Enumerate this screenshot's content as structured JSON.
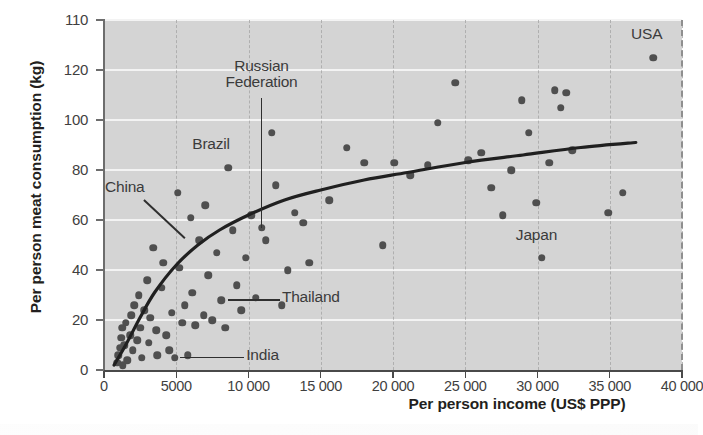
{
  "chart_data": {
    "type": "scatter",
    "title": "",
    "xlabel": "Per person income (US$ PPP)",
    "ylabel": "Per person meat consumption (kg)",
    "xlim": [
      0,
      40000
    ],
    "ylim": [
      0,
      140
    ],
    "xticks": [
      0,
      5000,
      10000,
      15000,
      20000,
      25000,
      30000,
      35000,
      40000
    ],
    "xticklabels": [
      "0",
      "5000",
      "10 000",
      "15 000",
      "20 000",
      "25 000",
      "30 000",
      "35 000",
      "40 000"
    ],
    "yticks": [
      0,
      20,
      40,
      60,
      80,
      100,
      120,
      140
    ],
    "yticklabels": [
      "0",
      "20",
      "40",
      "60",
      "80",
      "100",
      "120",
      "110"
    ],
    "grid": "horizontal-white-lines-and-vertical-dashed",
    "legend": "none",
    "plot_background": "#d4d4d4",
    "marker_color": "#4f4f4f",
    "trend_color": "#202020",
    "points": [
      {
        "x": 900,
        "y": 3
      },
      {
        "x": 1000,
        "y": 6
      },
      {
        "x": 1100,
        "y": 9
      },
      {
        "x": 1200,
        "y": 13
      },
      {
        "x": 1250,
        "y": 17
      },
      {
        "x": 1300,
        "y": 2
      },
      {
        "x": 1400,
        "y": 10
      },
      {
        "x": 1500,
        "y": 19
      },
      {
        "x": 1600,
        "y": 4
      },
      {
        "x": 1800,
        "y": 14
      },
      {
        "x": 1900,
        "y": 22
      },
      {
        "x": 2000,
        "y": 8
      },
      {
        "x": 2100,
        "y": 26
      },
      {
        "x": 2300,
        "y": 12
      },
      {
        "x": 2400,
        "y": 30
      },
      {
        "x": 2500,
        "y": 17
      },
      {
        "x": 2600,
        "y": 5
      },
      {
        "x": 2800,
        "y": 24
      },
      {
        "x": 3000,
        "y": 36
      },
      {
        "x": 3100,
        "y": 11
      },
      {
        "x": 3200,
        "y": 21
      },
      {
        "x": 3400,
        "y": 49
      },
      {
        "x": 3600,
        "y": 16
      },
      {
        "x": 3700,
        "y": 6
      },
      {
        "x": 4000,
        "y": 33
      },
      {
        "x": 4100,
        "y": 43
      },
      {
        "x": 4300,
        "y": 14
      },
      {
        "x": 4500,
        "y": 8
      },
      {
        "x": 4700,
        "y": 23
      },
      {
        "x": 4900,
        "y": 5
      },
      {
        "x": 5100,
        "y": 71
      },
      {
        "x": 5200,
        "y": 41
      },
      {
        "x": 5400,
        "y": 19
      },
      {
        "x": 5600,
        "y": 26
      },
      {
        "x": 5800,
        "y": 6
      },
      {
        "x": 6000,
        "y": 61
      },
      {
        "x": 6100,
        "y": 31
      },
      {
        "x": 6300,
        "y": 18
      },
      {
        "x": 6600,
        "y": 52
      },
      {
        "x": 6900,
        "y": 22
      },
      {
        "x": 7000,
        "y": 66
      },
      {
        "x": 7200,
        "y": 38
      },
      {
        "x": 7500,
        "y": 20
      },
      {
        "x": 7800,
        "y": 47
      },
      {
        "x": 8100,
        "y": 28
      },
      {
        "x": 8400,
        "y": 17
      },
      {
        "x": 8600,
        "y": 81
      },
      {
        "x": 8900,
        "y": 56
      },
      {
        "x": 9200,
        "y": 34
      },
      {
        "x": 9500,
        "y": 24
      },
      {
        "x": 9800,
        "y": 45
      },
      {
        "x": 10200,
        "y": 62
      },
      {
        "x": 10500,
        "y": 29
      },
      {
        "x": 10900,
        "y": 57
      },
      {
        "x": 11200,
        "y": 52
      },
      {
        "x": 11600,
        "y": 95
      },
      {
        "x": 11900,
        "y": 74
      },
      {
        "x": 12300,
        "y": 26
      },
      {
        "x": 12700,
        "y": 40
      },
      {
        "x": 13200,
        "y": 63
      },
      {
        "x": 13800,
        "y": 59
      },
      {
        "x": 14200,
        "y": 43
      },
      {
        "x": 15600,
        "y": 68
      },
      {
        "x": 16800,
        "y": 89
      },
      {
        "x": 18000,
        "y": 83
      },
      {
        "x": 19300,
        "y": 50
      },
      {
        "x": 20100,
        "y": 83
      },
      {
        "x": 21200,
        "y": 78
      },
      {
        "x": 22400,
        "y": 82
      },
      {
        "x": 23100,
        "y": 99
      },
      {
        "x": 24300,
        "y": 115
      },
      {
        "x": 25200,
        "y": 84
      },
      {
        "x": 26100,
        "y": 87
      },
      {
        "x": 26800,
        "y": 73
      },
      {
        "x": 27600,
        "y": 62
      },
      {
        "x": 28200,
        "y": 80
      },
      {
        "x": 28900,
        "y": 108
      },
      {
        "x": 29400,
        "y": 95
      },
      {
        "x": 29900,
        "y": 67
      },
      {
        "x": 30300,
        "y": 45
      },
      {
        "x": 30800,
        "y": 83
      },
      {
        "x": 31200,
        "y": 112
      },
      {
        "x": 31600,
        "y": 105
      },
      {
        "x": 32000,
        "y": 111
      },
      {
        "x": 32400,
        "y": 88
      },
      {
        "x": 34900,
        "y": 63
      },
      {
        "x": 35900,
        "y": 71
      },
      {
        "x": 38000,
        "y": 125
      }
    ],
    "trend": [
      {
        "x": 700,
        "y": 2
      },
      {
        "x": 1500,
        "y": 10
      },
      {
        "x": 2500,
        "y": 21
      },
      {
        "x": 3500,
        "y": 31
      },
      {
        "x": 5000,
        "y": 42
      },
      {
        "x": 6500,
        "y": 50
      },
      {
        "x": 8000,
        "y": 56
      },
      {
        "x": 10000,
        "y": 62
      },
      {
        "x": 12500,
        "y": 68
      },
      {
        "x": 15000,
        "y": 72
      },
      {
        "x": 18000,
        "y": 76
      },
      {
        "x": 21000,
        "y": 79
      },
      {
        "x": 25000,
        "y": 83
      },
      {
        "x": 29000,
        "y": 86
      },
      {
        "x": 33000,
        "y": 89
      },
      {
        "x": 36800,
        "y": 91
      }
    ],
    "annotations": [
      {
        "label": "USA",
        "x": 38000,
        "y": 125,
        "style": "above"
      },
      {
        "label": "Japan",
        "x": 30300,
        "y": 45,
        "style": "above"
      },
      {
        "label": "Russian Federation",
        "x": 10900,
        "y": 57,
        "style": "vertical-leader"
      },
      {
        "label": "Brazil",
        "x": 8600,
        "y": 81,
        "style": "above"
      },
      {
        "label": "China",
        "x": 5900,
        "y": 52,
        "style": "diagonal-leader"
      },
      {
        "label": "Thailand",
        "x": 8300,
        "y": 28,
        "style": "horizontal-leader-right"
      },
      {
        "label": "India",
        "x": 5000,
        "y": 5,
        "style": "horizontal-leader-right"
      }
    ]
  },
  "annotation_text": {
    "usa": "USA",
    "japan": "Japan",
    "russian_line1": "Russian",
    "russian_line2": "Federation",
    "brazil": "Brazil",
    "china": "China",
    "thailand": "Thailand",
    "india": "India"
  }
}
